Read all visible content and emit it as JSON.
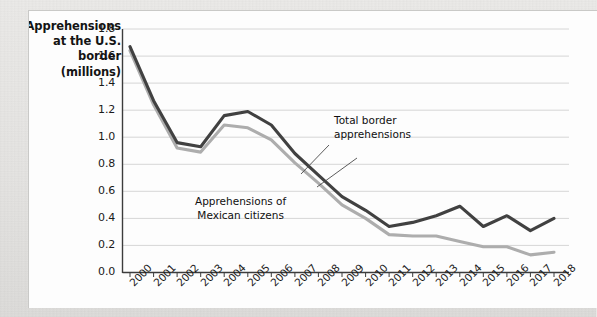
{
  "chart_data": {
    "type": "line",
    "title": "",
    "ylabel": "Apprehensions at the U.S. border (millions)",
    "ylabel_lines": [
      "Apprehensions",
      "at the U.S.",
      "border",
      "(millions)"
    ],
    "xlabel": "",
    "grid": true,
    "legend_position": "inline-annotations",
    "ylim": [
      0.0,
      1.8
    ],
    "yticks": [
      "0.0",
      "0.2",
      "0.4",
      "0.6",
      "0.8",
      "1.0",
      "1.2",
      "1.4",
      "1.6",
      "1.8"
    ],
    "categories": [
      "2000",
      "2001",
      "2002",
      "2003",
      "2004",
      "2005",
      "2006",
      "2007",
      "2008",
      "2009",
      "2010",
      "2011",
      "2012",
      "2013",
      "2014",
      "2015",
      "2016",
      "2017",
      "2018"
    ],
    "series": [
      {
        "name": "Total border apprehensions",
        "color": "#414141",
        "annotation_lines": [
          "Total border",
          "apprehensions"
        ],
        "values": [
          1.67,
          1.27,
          0.96,
          0.93,
          1.16,
          1.19,
          1.09,
          0.88,
          0.72,
          0.56,
          0.46,
          0.34,
          0.37,
          0.42,
          0.49,
          0.34,
          0.42,
          0.31,
          0.4
        ]
      },
      {
        "name": "Apprehensions of Mexican citizens",
        "color": "#adadad",
        "annotation_lines": [
          "Apprehensions of",
          "Mexican citizens"
        ],
        "values": [
          1.64,
          1.24,
          0.92,
          0.89,
          1.09,
          1.07,
          0.98,
          0.81,
          0.66,
          0.5,
          0.4,
          0.28,
          0.27,
          0.27,
          0.23,
          0.19,
          0.19,
          0.13,
          0.15
        ]
      }
    ],
    "colors": {
      "total_line": "#414141",
      "mexican_line": "#adadad",
      "grid": "#d6d6d6",
      "axis": "#3c3c3c",
      "panel_background": "#fdfdfd",
      "page_background": "#e8e8e6"
    }
  }
}
